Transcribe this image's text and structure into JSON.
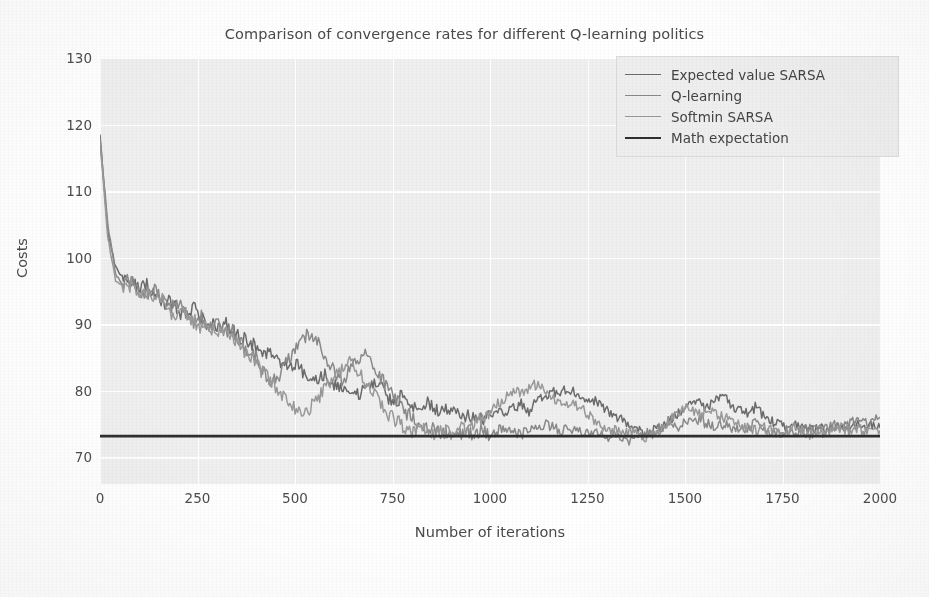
{
  "chart_data": {
    "type": "line",
    "title": "Comparison of convergence rates for different Q-learning politics",
    "xlabel": "Number of iterations",
    "ylabel": "Costs",
    "xlim": [
      0,
      2000
    ],
    "ylim": [
      66,
      130
    ],
    "xticks": [
      "0",
      "250",
      "500",
      "750",
      "1000",
      "1250",
      "1500",
      "1750",
      "2000"
    ],
    "yticks": [
      "70",
      "80",
      "90",
      "100",
      "110",
      "120",
      "130"
    ],
    "grid": true,
    "legend_position": "upper right",
    "style": "grayscale scanned figure, light gray axes background with white gridlines",
    "series": [
      {
        "name": "Expected value SARSA",
        "color": "#6b6b6b",
        "width": 1.5,
        "x": [
          0,
          20,
          40,
          60,
          80,
          100,
          120,
          140,
          160,
          180,
          200,
          220,
          240,
          260,
          280,
          300,
          320,
          340,
          360,
          380,
          400,
          420,
          440,
          460,
          480,
          500,
          520,
          540,
          560,
          580,
          600,
          620,
          640,
          660,
          680,
          700,
          720,
          740,
          760,
          780,
          800,
          820,
          840,
          860,
          880,
          900,
          920,
          940,
          960,
          980,
          1000,
          1020,
          1040,
          1060,
          1080,
          1100,
          1120,
          1140,
          1160,
          1180,
          1200,
          1220,
          1240,
          1260,
          1280,
          1300,
          1320,
          1340,
          1360,
          1380,
          1400,
          1420,
          1440,
          1460,
          1480,
          1500,
          1520,
          1540,
          1560,
          1580,
          1600,
          1620,
          1640,
          1660,
          1680,
          1700,
          1720,
          1740,
          1760,
          1780,
          1800,
          1820,
          1840,
          1860,
          1880,
          1900,
          1920,
          1940,
          1960,
          1980,
          2000
        ],
        "y": [
          118.5,
          104.0,
          98.5,
          97.0,
          96.5,
          95.5,
          96.0,
          94.0,
          93.0,
          93.5,
          92.0,
          91.5,
          92.5,
          91.0,
          90.0,
          89.5,
          90.5,
          89.0,
          88.0,
          87.5,
          86.5,
          85.5,
          86.0,
          84.5,
          83.5,
          84.0,
          83.0,
          82.0,
          81.5,
          82.5,
          81.0,
          80.0,
          80.5,
          79.5,
          80.0,
          81.0,
          80.5,
          79.0,
          78.5,
          79.5,
          78.0,
          77.5,
          78.5,
          77.0,
          77.5,
          76.5,
          77.0,
          76.0,
          76.5,
          75.5,
          76.0,
          77.0,
          76.5,
          77.5,
          78.0,
          77.0,
          78.5,
          79.0,
          80.0,
          79.5,
          80.5,
          79.5,
          78.5,
          79.0,
          78.0,
          77.0,
          76.5,
          75.5,
          74.5,
          74.0,
          73.5,
          74.0,
          74.5,
          75.5,
          76.5,
          77.5,
          78.5,
          78.0,
          77.5,
          78.5,
          79.0,
          78.0,
          77.0,
          76.5,
          77.5,
          76.5,
          75.5,
          75.0,
          74.5,
          75.0,
          74.5,
          74.0,
          74.5,
          74.0,
          74.5,
          74.0,
          74.5,
          75.0,
          74.5,
          75.0,
          74.5
        ]
      },
      {
        "name": "Q-learning",
        "color": "#8a8a8a",
        "width": 1.5,
        "x": [
          0,
          20,
          40,
          60,
          80,
          100,
          120,
          140,
          160,
          180,
          200,
          220,
          240,
          260,
          280,
          300,
          320,
          340,
          360,
          380,
          400,
          420,
          440,
          460,
          480,
          500,
          520,
          540,
          560,
          580,
          600,
          620,
          640,
          660,
          680,
          700,
          720,
          740,
          760,
          780,
          800,
          820,
          840,
          860,
          880,
          900,
          920,
          940,
          960,
          980,
          1000,
          1020,
          1040,
          1060,
          1080,
          1100,
          1120,
          1140,
          1160,
          1180,
          1200,
          1220,
          1240,
          1260,
          1280,
          1300,
          1320,
          1340,
          1360,
          1380,
          1400,
          1420,
          1440,
          1460,
          1480,
          1500,
          1520,
          1540,
          1560,
          1580,
          1600,
          1620,
          1640,
          1660,
          1680,
          1700,
          1720,
          1740,
          1760,
          1780,
          1800,
          1820,
          1840,
          1860,
          1880,
          1900,
          1920,
          1940,
          1960,
          1980,
          2000
        ],
        "y": [
          118.0,
          105.0,
          97.5,
          96.0,
          97.0,
          95.0,
          94.5,
          95.5,
          93.5,
          92.5,
          93.0,
          91.5,
          90.5,
          91.0,
          89.5,
          90.0,
          88.5,
          89.0,
          87.5,
          86.0,
          85.0,
          83.0,
          81.0,
          82.5,
          84.5,
          86.5,
          88.0,
          88.5,
          87.0,
          85.0,
          83.0,
          81.5,
          83.0,
          84.5,
          85.5,
          84.0,
          82.0,
          80.0,
          78.5,
          77.0,
          76.0,
          75.0,
          74.5,
          74.0,
          73.5,
          74.0,
          73.5,
          74.0,
          73.5,
          74.0,
          73.5,
          74.0,
          74.5,
          74.0,
          73.5,
          74.0,
          74.5,
          75.0,
          74.5,
          74.0,
          74.5,
          74.0,
          73.5,
          74.0,
          73.5,
          73.0,
          73.5,
          73.0,
          72.5,
          73.0,
          73.5,
          74.0,
          74.5,
          75.0,
          74.5,
          75.5,
          76.0,
          75.5,
          75.0,
          74.5,
          75.0,
          74.5,
          74.0,
          74.5,
          75.0,
          74.5,
          74.0,
          73.5,
          74.0,
          73.5,
          74.0,
          74.5,
          74.0,
          74.5,
          75.0,
          74.5,
          75.0,
          75.5,
          75.0,
          75.5,
          76.0
        ]
      },
      {
        "name": "Softmin SARSA",
        "color": "#999999",
        "width": 1.5,
        "x": [
          0,
          20,
          40,
          60,
          80,
          100,
          120,
          140,
          160,
          180,
          200,
          220,
          240,
          260,
          280,
          300,
          320,
          340,
          360,
          380,
          400,
          420,
          440,
          460,
          480,
          500,
          520,
          540,
          560,
          580,
          600,
          620,
          640,
          660,
          680,
          700,
          720,
          740,
          760,
          780,
          800,
          820,
          840,
          860,
          880,
          900,
          920,
          940,
          960,
          980,
          1000,
          1020,
          1040,
          1060,
          1080,
          1100,
          1120,
          1140,
          1160,
          1180,
          1200,
          1220,
          1240,
          1260,
          1280,
          1300,
          1320,
          1340,
          1360,
          1380,
          1400,
          1420,
          1440,
          1460,
          1480,
          1500,
          1520,
          1540,
          1560,
          1580,
          1600,
          1620,
          1640,
          1660,
          1680,
          1700,
          1720,
          1740,
          1760,
          1780,
          1800,
          1820,
          1840,
          1860,
          1880,
          1900,
          1920,
          1940,
          1960,
          1980,
          2000
        ],
        "y": [
          117.5,
          103.0,
          96.5,
          95.5,
          96.0,
          94.5,
          95.0,
          93.0,
          94.0,
          92.0,
          91.0,
          92.0,
          90.5,
          89.5,
          90.0,
          88.5,
          89.5,
          88.0,
          86.5,
          85.5,
          84.0,
          82.5,
          81.5,
          80.0,
          78.5,
          77.5,
          76.5,
          77.5,
          79.0,
          80.5,
          82.0,
          83.5,
          84.5,
          83.0,
          81.5,
          80.0,
          78.0,
          76.5,
          75.5,
          74.5,
          74.0,
          74.5,
          74.0,
          73.5,
          74.0,
          73.5,
          74.5,
          74.0,
          75.0,
          76.0,
          77.0,
          78.0,
          79.0,
          80.0,
          79.5,
          80.5,
          81.0,
          80.0,
          79.0,
          78.0,
          77.5,
          78.0,
          77.0,
          76.0,
          75.0,
          74.5,
          74.0,
          73.5,
          74.0,
          73.5,
          73.0,
          73.5,
          74.5,
          75.5,
          76.5,
          77.5,
          77.0,
          76.5,
          77.0,
          76.5,
          76.0,
          75.5,
          75.0,
          74.5,
          74.0,
          74.5,
          74.0,
          73.5,
          74.0,
          74.5,
          74.0,
          73.5,
          74.0,
          73.5,
          74.0,
          74.5,
          74.0,
          74.5,
          74.0,
          74.5,
          74.0
        ]
      },
      {
        "name": "Math expectation",
        "color": "#2f2f2f",
        "width": 2.6,
        "x": [
          0,
          2000
        ],
        "y": [
          73.2,
          73.2
        ]
      }
    ]
  },
  "legend": {
    "entries": [
      {
        "label": "Expected value SARSA"
      },
      {
        "label": "Q-learning"
      },
      {
        "label": "Softmin SARSA"
      },
      {
        "label": "Math expectation"
      }
    ]
  }
}
